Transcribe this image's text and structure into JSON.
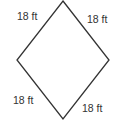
{
  "shape": "rhombus",
  "stroke_color": "#333333",
  "labels": {
    "top_left": "18 ft",
    "top_right": "18 ft",
    "bottom_left": "18 ft",
    "bottom_right": "18 ft"
  }
}
